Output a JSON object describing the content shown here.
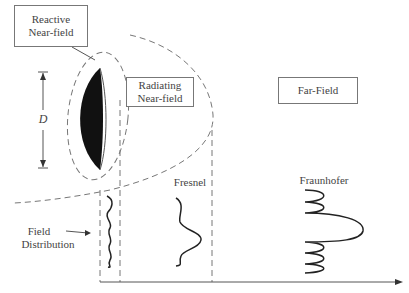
{
  "diagram": {
    "regions": {
      "reactive": {
        "line1": "Reactive",
        "line2": "Near-field"
      },
      "radiating": {
        "line1": "Radiating",
        "line2": "Near-field"
      },
      "far": {
        "label": "Far-Field"
      }
    },
    "dimension_label": "D",
    "distributions": {
      "near": {
        "line1": "Field",
        "line2": "Distribution"
      },
      "fresnel": "Fresnel",
      "fraunhofer": "Fraunhofer"
    },
    "colors": {
      "line": "#555555",
      "dish": "#111111",
      "dash": "#777777"
    }
  }
}
